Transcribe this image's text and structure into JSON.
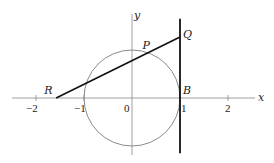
{
  "diagram": {
    "axes": {
      "x_label": "x",
      "y_label": "y",
      "x_ticks": [
        {
          "value": -2,
          "label": "−2"
        },
        {
          "value": -1,
          "label": "−1"
        },
        {
          "value": 0,
          "label": "0"
        },
        {
          "value": 1,
          "label": "1"
        },
        {
          "value": 2,
          "label": "2"
        }
      ]
    },
    "circle": {
      "center": [
        0,
        0
      ],
      "radius": 1,
      "color": "#8a8a8a"
    },
    "tangent_line": {
      "x": 1,
      "y_range": [
        -1.15,
        1.65
      ],
      "color": "#111111"
    },
    "points": {
      "R": {
        "label": "R",
        "coords": [
          -1.58,
          0
        ]
      },
      "P": {
        "label": "P",
        "coords": [
          0.3,
          0.95
        ]
      },
      "Q": {
        "label": "Q",
        "coords": [
          1,
          1.27
        ]
      },
      "B": {
        "label": "B",
        "coords": [
          1,
          0
        ]
      },
      "O": {
        "label": "0",
        "coords": [
          0,
          0
        ]
      }
    },
    "segment_RQ": {
      "from": "R",
      "to": "Q",
      "color": "#111111"
    }
  }
}
